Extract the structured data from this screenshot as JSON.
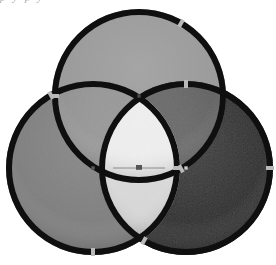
{
  "figure": {
    "background_color": "#ffffff",
    "width": 276,
    "height": 265,
    "clipped_top_text": "p    y    p    y"
  },
  "chart_data": {
    "type": "venn",
    "subtitle": "",
    "xlabel": "",
    "ylabel": "",
    "grid": false,
    "legend_position": "none",
    "units": "pixels",
    "xlim": [
      0,
      276
    ],
    "ylim": [
      0,
      265
    ],
    "rim": {
      "color": "#100f0f",
      "highlight_color": "#3a3a3a",
      "width_px": 6,
      "tick_color": "#b9b9b9",
      "tick_length_px": 9,
      "tick_width_px": 4
    },
    "sets": [
      {
        "name": "top",
        "label": "A",
        "cx": 139,
        "cy": 96,
        "r": 87,
        "fill": "#9a9a9a",
        "center_marker_color": "#4a4a4a",
        "tick_angles_deg": [
          270,
          150,
          30
        ]
      },
      {
        "name": "left",
        "label": "B",
        "cx": 93,
        "cy": 168,
        "r": 87,
        "fill": "#7f7f7f",
        "center_marker_color": "#5a5a5a",
        "tick_angles_deg": [
          180,
          90,
          330
        ]
      },
      {
        "name": "right",
        "label": "C",
        "cx": 186,
        "cy": 168,
        "r": 87,
        "fill": "#2e2e2e",
        "center_marker_color": "#c9c9c9",
        "tick_angles_deg": [
          0,
          90,
          210
        ]
      }
    ],
    "regions": [
      {
        "id": "top_only",
        "sets": [
          "top"
        ],
        "fill": "#9a9a9a"
      },
      {
        "id": "left_only",
        "sets": [
          "left"
        ],
        "fill": "#7f7f7f"
      },
      {
        "id": "right_only",
        "sets": [
          "right"
        ],
        "fill": "#2e2e2e"
      },
      {
        "id": "top_left",
        "sets": [
          "top",
          "left"
        ],
        "fill": "#8f8f8f"
      },
      {
        "id": "top_right",
        "sets": [
          "top",
          "right"
        ],
        "fill": "#5c5c5c"
      },
      {
        "id": "left_right",
        "sets": [
          "left",
          "right"
        ],
        "fill": "#d8d8d8"
      },
      {
        "id": "top_left_right",
        "sets": [
          "top",
          "left",
          "right"
        ],
        "fill": "#ededed"
      }
    ],
    "center_marker": {
      "x": 139,
      "y": 168,
      "color": "#555555",
      "bar_color": "#8c8c8c",
      "bar_width_px": 52,
      "size_px": 6
    }
  }
}
